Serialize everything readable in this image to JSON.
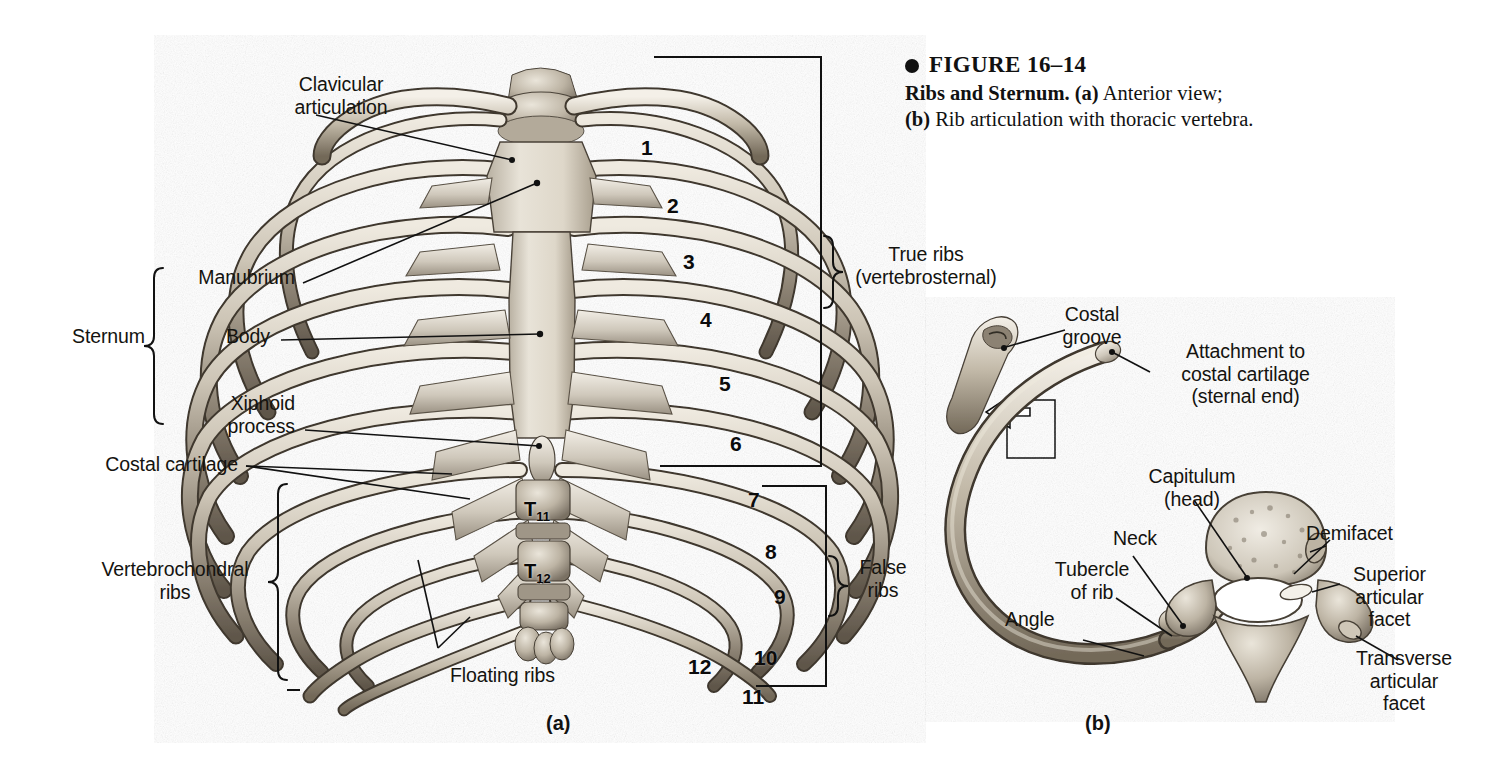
{
  "figure": {
    "number_label": "FIGURE 16–14",
    "title": "Ribs and Sternum.",
    "part_a_marker": "(a)",
    "part_a_text": "Anterior view;",
    "part_b_marker": "(b)",
    "part_b_text": "Rib articulation with thoracic vertebra.",
    "bullet": "bullet-dot"
  },
  "panel_a": {
    "letter": "(a)",
    "labels": {
      "clavicular_articulation": "Clavicular\narticulation",
      "sternum_group": "Sternum",
      "manubrium": "Manubrium",
      "body": "Body",
      "xiphoid_process": "Xiphoid\nprocess",
      "costal_cartilage": "Costal cartilage",
      "vertebrochondral_ribs": "Vertebrochondral\nribs",
      "floating_ribs": "Floating ribs",
      "true_ribs": "True ribs\n(vertebrosternal)",
      "false_ribs": "False\nribs"
    },
    "rib_numbers": [
      "1",
      "2",
      "3",
      "4",
      "5",
      "6",
      "7",
      "8",
      "9",
      "10",
      "11",
      "12"
    ],
    "vertebrae": [
      {
        "letter": "T",
        "sub": "11"
      },
      {
        "letter": "T",
        "sub": "12"
      }
    ]
  },
  "panel_b": {
    "letter": "(b)",
    "labels": {
      "costal_groove": "Costal\ngroove",
      "attachment": "Attachment to\ncostal cartilage\n(sternal end)",
      "capitulum": "Capitulum\n(head)",
      "neck": "Neck",
      "demifacet": "Demifacet",
      "tubercle_of_rib": "Tubercle\nof rib",
      "angle": "Angle",
      "superior_articular_facet": "Superior\narticular\nfacet",
      "transverse_articular_facet": "Transverse\narticular\nfacet"
    }
  },
  "colors": {
    "ink": "#111111",
    "page": "#ffffff",
    "bone_light": "#d8d2c6",
    "bone_mid": "#a79c8c",
    "bone_dark": "#6d6355",
    "cartilage": "#c7c0b4"
  }
}
